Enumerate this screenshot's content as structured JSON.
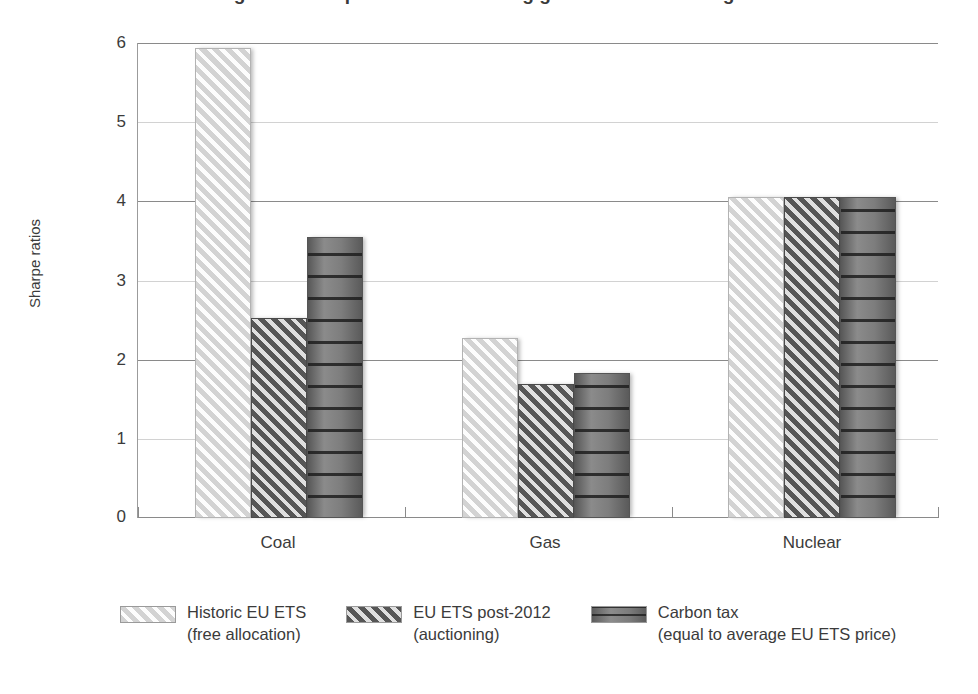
{
  "chart_data": {
    "type": "bar",
    "title": "Figure 3. Sharpe ratios for existing generation technologies",
    "xlabel": "",
    "ylabel": "Sharpe ratios",
    "categories": [
      "Coal",
      "Gas",
      "Nuclear"
    ],
    "series": [
      {
        "name": "Historic EU ETS",
        "name_line2": "(free allocation)",
        "pattern": "light-gray-diagonal-hatch",
        "color": "#d3d3d3",
        "values": [
          5.94,
          2.27,
          4.06
        ]
      },
      {
        "name": "EU ETS post-2012",
        "name_line2": "(auctioning)",
        "pattern": "dark-gray-diagonal-hatch",
        "color": "#565656",
        "values": [
          2.53,
          1.69,
          4.06
        ]
      },
      {
        "name": "Carbon tax",
        "name_line2": "(equal to average EU ETS price)",
        "pattern": "gray-horizontal-lines",
        "color": "#707070",
        "values": [
          3.55,
          1.83,
          4.05
        ]
      }
    ],
    "ylim": [
      0,
      6
    ],
    "yticks": [
      "0",
      "1",
      "2",
      "3",
      "4",
      "5",
      "6"
    ],
    "grid": "horizontal",
    "legend_position": "bottom"
  },
  "legend": [
    {
      "line1": "Historic EU ETS",
      "line2": "(free allocation)"
    },
    {
      "line1": "EU ETS post-2012",
      "line2": "(auctioning)"
    },
    {
      "line1": "Carbon tax",
      "line2": "(equal to average EU ETS price)"
    }
  ]
}
